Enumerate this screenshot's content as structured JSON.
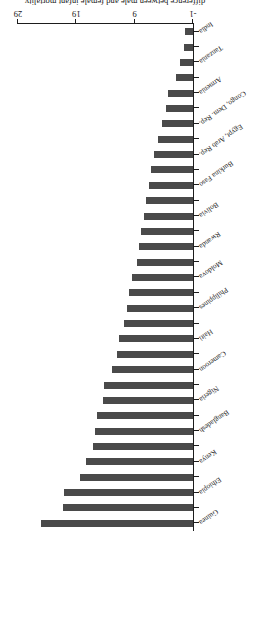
{
  "chart_data": {
    "type": "bar",
    "orientation": "horizontal",
    "title": "",
    "xlabel": "difference between male and female infant mortality",
    "ylabel": "",
    "xlim": [
      -1,
      29
    ],
    "xticks": [
      -1,
      9,
      19,
      29
    ],
    "xticklabels": [
      "-1",
      "9",
      "19",
      "29"
    ],
    "grid": false,
    "legend": null,
    "bar_color": "#4a4a4a",
    "axis_color": "#1d1d1d",
    "rotated_180": true,
    "categories": [
      "Guinea",
      "Uganda",
      "Ethiopia",
      "Cambodia",
      "Kenya",
      "Senegal",
      "Bangladesh",
      "Chad",
      "Nigeria",
      "Morocco",
      "Cameroon",
      "Madagascar",
      "Haiti",
      "Lesotho",
      "Philippines",
      "Malawi",
      "Moldova",
      "Colombia",
      "Rwanda",
      "Mozambique",
      "Bolivia",
      "Pakistan",
      "Burkina Faso",
      "Niger",
      "Egypt, Arab Rep.",
      "Indonesia",
      "Congo, Dem. Rep.",
      "Honduras",
      "Armenia",
      "Zimbabwe",
      "Tanzania",
      "Nepal",
      "India"
    ],
    "values": [
      25.1,
      21.2,
      21.1,
      18.3,
      17.4,
      16.2,
      15.8,
      15.5,
      14.4,
      14.3,
      12.8,
      12.1,
      11.7,
      10.8,
      10.3,
      9.9,
      9.4,
      8.6,
      8.2,
      7.9,
      7.4,
      7.0,
      6.6,
      6.2,
      5.6,
      5.0,
      4.3,
      3.7,
      3.2,
      1.9,
      1.2,
      0.6,
      0.3
    ]
  }
}
